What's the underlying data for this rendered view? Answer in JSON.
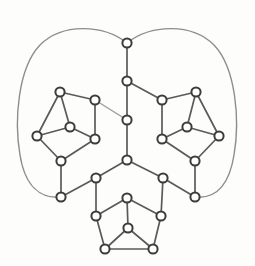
{
  "figure": {
    "background_color": "#fdfdfc",
    "width": 255,
    "height": 266
  },
  "style": {
    "node_fill": "#ffffff",
    "node_stroke": "#3c3c3c",
    "node_radius": 4.6,
    "edge_color": "#5a5a5a",
    "faint_edge_color": "#9b9b9b",
    "boundary_color": "#8d8d8d"
  },
  "chart_data": {
    "type": "diagram",
    "title": "",
    "xlabel": "",
    "ylabel": "",
    "node_count": 25,
    "edge_count": 34,
    "nodes": [
      {
        "id": "apex",
        "x": 127,
        "y": 43,
        "group": "spine"
      },
      {
        "id": "s2",
        "x": 127,
        "y": 81,
        "group": "spine"
      },
      {
        "id": "s3",
        "x": 127,
        "y": 120,
        "group": "spine"
      },
      {
        "id": "s4",
        "x": 127,
        "y": 160,
        "group": "spine"
      },
      {
        "id": "lt",
        "x": 60,
        "y": 92,
        "group": "left-cluster"
      },
      {
        "id": "ltr",
        "x": 95,
        "y": 100,
        "group": "left-cluster"
      },
      {
        "id": "lc",
        "x": 70,
        "y": 127,
        "group": "left-cluster"
      },
      {
        "id": "ll",
        "x": 37,
        "y": 136,
        "group": "left-cluster"
      },
      {
        "id": "lr",
        "x": 95,
        "y": 139,
        "group": "left-cluster"
      },
      {
        "id": "lb",
        "x": 61,
        "y": 161,
        "group": "left-cluster"
      },
      {
        "id": "lout",
        "x": 61,
        "y": 197,
        "group": "left-cluster"
      },
      {
        "id": "rt",
        "x": 196,
        "y": 92,
        "group": "right-cluster"
      },
      {
        "id": "rtl",
        "x": 162,
        "y": 100,
        "group": "right-cluster"
      },
      {
        "id": "rc",
        "x": 187,
        "y": 127,
        "group": "right-cluster"
      },
      {
        "id": "rr",
        "x": 219,
        "y": 136,
        "group": "right-cluster"
      },
      {
        "id": "rl",
        "x": 162,
        "y": 139,
        "group": "right-cluster"
      },
      {
        "id": "rb",
        "x": 195,
        "y": 161,
        "group": "right-cluster"
      },
      {
        "id": "rout",
        "x": 195,
        "y": 197,
        "group": "right-cluster"
      },
      {
        "id": "ml",
        "x": 96,
        "y": 178,
        "group": "mid"
      },
      {
        "id": "mr",
        "x": 163,
        "y": 178,
        "group": "mid"
      },
      {
        "id": "bt",
        "x": 127,
        "y": 198,
        "group": "bottom-cluster"
      },
      {
        "id": "bl",
        "x": 96,
        "y": 216,
        "group": "bottom-cluster"
      },
      {
        "id": "br",
        "x": 161,
        "y": 216,
        "group": "bottom-cluster"
      },
      {
        "id": "bc",
        "x": 128,
        "y": 228,
        "group": "bottom-cluster"
      },
      {
        "id": "bbl",
        "x": 105,
        "y": 249,
        "group": "bottom-cluster"
      },
      {
        "id": "bbr",
        "x": 153,
        "y": 249,
        "group": "bottom-cluster"
      }
    ],
    "edges": [
      {
        "from": "apex",
        "to": "s2",
        "style": "solid"
      },
      {
        "from": "s2",
        "to": "s3",
        "style": "solid"
      },
      {
        "from": "s3",
        "to": "s4",
        "style": "solid"
      },
      {
        "from": "s2",
        "to": "rtl",
        "style": "solid"
      },
      {
        "from": "ltr",
        "to": "s3",
        "style": "faint"
      },
      {
        "from": "lt",
        "to": "ltr",
        "style": "solid"
      },
      {
        "from": "lt",
        "to": "ll",
        "style": "solid"
      },
      {
        "from": "lt",
        "to": "lc",
        "style": "solid"
      },
      {
        "from": "ltr",
        "to": "lr",
        "style": "solid"
      },
      {
        "from": "lc",
        "to": "ll",
        "style": "solid"
      },
      {
        "from": "lc",
        "to": "lr",
        "style": "solid"
      },
      {
        "from": "ll",
        "to": "lb",
        "style": "solid"
      },
      {
        "from": "lr",
        "to": "lb",
        "style": "solid"
      },
      {
        "from": "lb",
        "to": "lout",
        "style": "solid"
      },
      {
        "from": "lout",
        "to": "ml",
        "style": "solid"
      },
      {
        "from": "rt",
        "to": "rtl",
        "style": "solid"
      },
      {
        "from": "rt",
        "to": "rr",
        "style": "solid"
      },
      {
        "from": "rt",
        "to": "rc",
        "style": "solid"
      },
      {
        "from": "rtl",
        "to": "rl",
        "style": "solid"
      },
      {
        "from": "rc",
        "to": "rr",
        "style": "solid"
      },
      {
        "from": "rc",
        "to": "rl",
        "style": "solid"
      },
      {
        "from": "rr",
        "to": "rb",
        "style": "solid"
      },
      {
        "from": "rl",
        "to": "rb",
        "style": "solid"
      },
      {
        "from": "rb",
        "to": "rout",
        "style": "solid"
      },
      {
        "from": "rout",
        "to": "mr",
        "style": "solid"
      },
      {
        "from": "s4",
        "to": "ml",
        "style": "solid"
      },
      {
        "from": "s4",
        "to": "mr",
        "style": "solid"
      },
      {
        "from": "ml",
        "to": "bl",
        "style": "solid"
      },
      {
        "from": "mr",
        "to": "br",
        "style": "solid"
      },
      {
        "from": "bt",
        "to": "bl",
        "style": "solid"
      },
      {
        "from": "bt",
        "to": "br",
        "style": "solid"
      },
      {
        "from": "bt",
        "to": "bc",
        "style": "solid"
      },
      {
        "from": "bl",
        "to": "bbl",
        "style": "solid"
      },
      {
        "from": "br",
        "to": "bbr",
        "style": "solid"
      },
      {
        "from": "bc",
        "to": "bbl",
        "style": "solid"
      },
      {
        "from": "bc",
        "to": "bbr",
        "style": "solid"
      },
      {
        "from": "bbl",
        "to": "bbr",
        "style": "solid"
      }
    ],
    "boundaries": [
      {
        "id": "left-lobe",
        "path": "M 127 43 C 103 24, 62 23, 40 45 C 18 68, 14 120, 20 155 C 25 186, 40 199, 61 197"
      },
      {
        "id": "right-lobe",
        "path": "M 127 43 C 151 24, 192 23, 214 45 C 236 68, 240 120, 234 155 C 229 186, 215 199, 195 197"
      }
    ]
  }
}
